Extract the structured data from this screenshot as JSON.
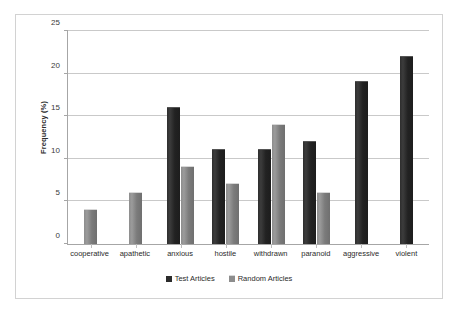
{
  "chart_data": {
    "type": "bar",
    "title": "",
    "xlabel": "",
    "ylabel": "Frequency (%)",
    "ylim": [
      0,
      25
    ],
    "ytick_labels": [
      "25",
      "20",
      "15",
      "10",
      "5",
      "0"
    ],
    "ytick_values": [
      25,
      20,
      15,
      10,
      5,
      0
    ],
    "grid": true,
    "legend_position": "bottom",
    "categories": [
      "cooperative",
      "apathetic",
      "anxious",
      "hostile",
      "withdrawn",
      "paranoid",
      "aggressive",
      "violent"
    ],
    "series": [
      {
        "name": "Test Articles",
        "color": "#2b2b2b",
        "values": [
          0,
          0,
          16,
          11,
          11,
          12,
          19,
          22
        ]
      },
      {
        "name": "Random Articles",
        "color": "#8d8d8d",
        "values": [
          4,
          6,
          9,
          7,
          14,
          6,
          0,
          0
        ]
      }
    ]
  },
  "legend": {
    "items": [
      {
        "label": "Test Articles",
        "swatch": "test"
      },
      {
        "label": "Random Articles",
        "swatch": "random"
      }
    ]
  },
  "colors": {
    "series_test": "#2b2b2b",
    "series_random": "#8d8d8d",
    "axis": "#a6a6a6",
    "gridline": "#c9c9c9",
    "frame_border": "#d2d2d2",
    "text": "#2b2b2b",
    "background": "#ffffff"
  }
}
